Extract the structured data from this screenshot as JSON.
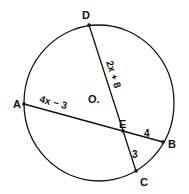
{
  "diagram": {
    "colors": {
      "stroke": "#111111",
      "background": "#ffffff"
    },
    "center": {
      "label": "O."
    },
    "points": {
      "A": {
        "label": "A"
      },
      "B": {
        "label": "B"
      },
      "C": {
        "label": "C"
      },
      "D": {
        "label": "D"
      },
      "E": {
        "label": "E"
      }
    },
    "segments": {
      "DE": {
        "label": "2x + 8"
      },
      "AE": {
        "label": "4x − 3"
      },
      "EB": {
        "label": "4"
      },
      "EC": {
        "label": "3"
      }
    }
  }
}
